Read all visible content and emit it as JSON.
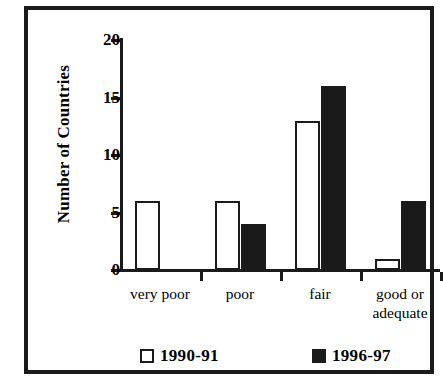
{
  "chart_data": {
    "type": "bar",
    "title": "",
    "xlabel": "",
    "ylabel": "Number of Countries",
    "ylim": [
      0,
      20
    ],
    "yticks": [
      0,
      5,
      10,
      15,
      20
    ],
    "grid": false,
    "legend_position": "bottom",
    "categories": [
      "very poor",
      "poor",
      "fair",
      "good or adequate"
    ],
    "category_lines": [
      [
        "very poor"
      ],
      [
        "poor"
      ],
      [
        "fair"
      ],
      [
        "good or",
        "adequate"
      ]
    ],
    "series": [
      {
        "name": "1990-91",
        "style": "open",
        "values": [
          6,
          6,
          13,
          1
        ]
      },
      {
        "name": "1996-97",
        "style": "filled",
        "values": [
          0,
          4,
          16,
          6
        ]
      }
    ]
  },
  "colors": {
    "ink": "#1a1a1a",
    "paper": "#ffffff"
  }
}
